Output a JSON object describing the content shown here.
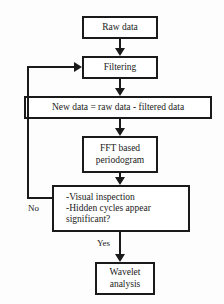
{
  "diagram": {
    "background_color": "#fdfdfd",
    "line_color": "#1a1a1a",
    "nodes": {
      "raw_data": "Raw data",
      "filtering": "Filtering",
      "new_data": "New data = raw data - filtered data",
      "fft": "FFT based\nperiodogram",
      "decision": "-Visual inspection\n-Hidden cycles appear\n  significant?",
      "wavelet": "Wavelet\nanalysis"
    },
    "edge_labels": {
      "no": "No",
      "yes": "Yes"
    }
  }
}
